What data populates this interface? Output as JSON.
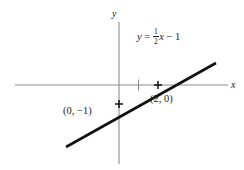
{
  "figure": {
    "type": "coordinate-plane-line-graph",
    "width": 244,
    "height": 170,
    "background_color": "#ffffff"
  },
  "axes": {
    "x_label": "x",
    "y_label": "y",
    "axis_color": "#8c8c8c",
    "origin_px": {
      "x": 119,
      "y": 85
    },
    "unit_px": 19.5,
    "x_axis_extent_px": {
      "start": 15,
      "end": 228
    },
    "y_axis_extent_px": {
      "start": 22,
      "end": 164
    },
    "ticks": [
      {
        "axis": "x",
        "value": "1",
        "show_number": false
      }
    ]
  },
  "equation": {
    "lhs": "y",
    "equals": "=",
    "coefficient_numerator": "1",
    "coefficient_denominator": "2",
    "variable": "x",
    "operator": "−",
    "constant": "1",
    "plain_text": "y = 1/2 x − 1"
  },
  "line": {
    "color": "#111111",
    "stroke_width": 2.6,
    "slope": 0.5,
    "y_intercept": -1,
    "endpoints_px": [
      {
        "x": 66,
        "y": 147
      },
      {
        "x": 216,
        "y": 63
      }
    ]
  },
  "points": [
    {
      "name": "y-intercept",
      "label": "(0, −1)",
      "coords": {
        "x": 0,
        "y": -1
      },
      "px": {
        "x": 119,
        "y": 104
      }
    },
    {
      "name": "x-intercept",
      "label": "(2, 0)",
      "coords": {
        "x": 2,
        "y": 0
      },
      "px": {
        "x": 158,
        "y": 85
      }
    }
  ]
}
